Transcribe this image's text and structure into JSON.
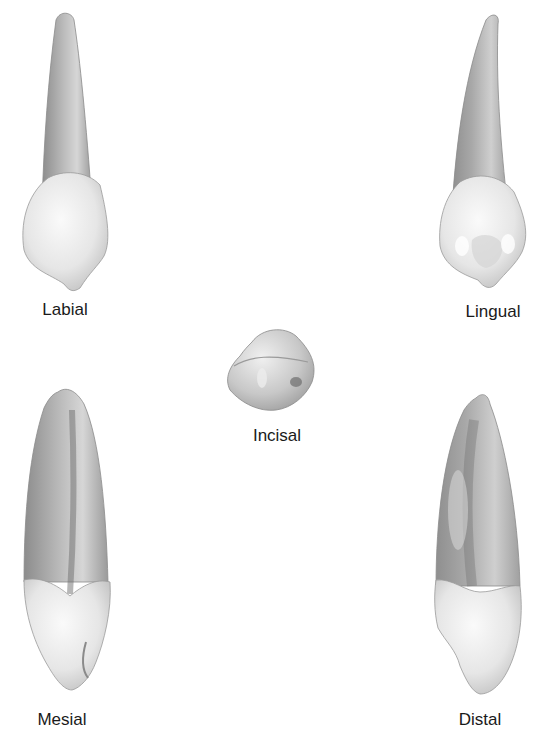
{
  "figure": {
    "views": [
      {
        "id": "labial",
        "label": "Labial"
      },
      {
        "id": "lingual",
        "label": "Lingual"
      },
      {
        "id": "incisal",
        "label": "Incisal"
      },
      {
        "id": "mesial",
        "label": "Mesial"
      },
      {
        "id": "distal",
        "label": "Distal"
      }
    ]
  },
  "colors": {
    "background": "#ffffff",
    "root_dark": "#8a8a8a",
    "root_light": "#cfcfcf",
    "crown_light": "#f2f2f2",
    "crown_shade": "#c4c4c4",
    "outline": "#7a7a7a",
    "label": "#1a1a1a"
  }
}
